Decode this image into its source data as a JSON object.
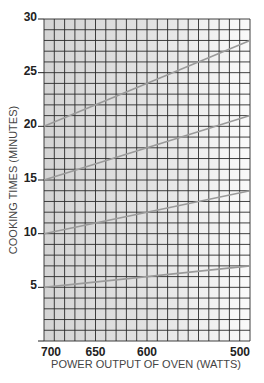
{
  "chart_data": {
    "type": "line",
    "title": "",
    "xlabel": "POWER OUTPUT OF OVEN (WATTS)",
    "ylabel": "COOKING TIMES (MINUTES)",
    "x": [
      700,
      500
    ],
    "x_ticks": [
      700,
      650,
      600,
      500
    ],
    "x_range": [
      700,
      500
    ],
    "y_ticks": [
      5,
      10,
      15,
      20,
      25,
      30
    ],
    "ylim": [
      0,
      30
    ],
    "grid": true,
    "grid_step_x": 10,
    "grid_step_y": 1,
    "legend": "none",
    "series": [
      {
        "name": "line-20min",
        "values": [
          20,
          28
        ]
      },
      {
        "name": "line-15min",
        "values": [
          15,
          21
        ]
      },
      {
        "name": "line-10min",
        "values": [
          10,
          14
        ]
      },
      {
        "name": "line-5min",
        "values": [
          5,
          7
        ]
      }
    ]
  },
  "colors": {
    "grid": "#2a2a2a",
    "line": "#9a9a9a",
    "shade_left": "#d9d9d9",
    "shade_right": "#f7f7f7"
  }
}
